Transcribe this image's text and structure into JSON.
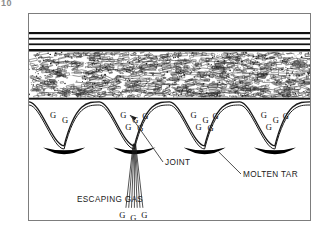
{
  "figure": {
    "number_label": "10"
  },
  "frame": {
    "border_color": "#7d7d7d",
    "background": "#ffffff"
  },
  "colors": {
    "ink": "#111111",
    "line": "#1a1a1a",
    "tar": "#000000",
    "aggregate": "#2b2b2b",
    "leader": "#3a3a3a",
    "frame_border": "#7d7d7d",
    "figure_number": "#8c8c8c"
  },
  "layers": [
    {
      "name": "top-void-space",
      "type": "white-gap",
      "y": 0,
      "height": 18,
      "fill": "#ffffff"
    },
    {
      "name": "membrane-ply-1",
      "type": "solid-line",
      "y": 18,
      "height": 2.4,
      "fill": "#111111"
    },
    {
      "name": "membrane-gap-1",
      "type": "white-gap",
      "y": 20.4,
      "height": 3.4,
      "fill": "#ffffff"
    },
    {
      "name": "membrane-ply-2",
      "type": "solid-line",
      "y": 23.8,
      "height": 2.0,
      "fill": "#111111"
    },
    {
      "name": "membrane-gap-2",
      "type": "white-gap",
      "y": 25.8,
      "height": 3.6,
      "fill": "#ffffff"
    },
    {
      "name": "membrane-ply-3",
      "type": "solid-line",
      "y": 29.4,
      "height": 2.0,
      "fill": "#111111"
    },
    {
      "name": "membrane-gap-3",
      "type": "white-gap",
      "y": 31.4,
      "height": 3.6,
      "fill": "#ffffff"
    },
    {
      "name": "membrane-ply-4",
      "type": "solid-line",
      "y": 35.0,
      "height": 2.6,
      "fill": "#111111"
    },
    {
      "name": "aggregate-fill-layer",
      "type": "texture",
      "y": 37.6,
      "height": 46,
      "fill": "#ffffff"
    },
    {
      "name": "deck-baseline",
      "type": "solid-line",
      "y": 83.6,
      "height": 2.2,
      "fill": "#111111"
    },
    {
      "name": "substrate-blister-zone",
      "type": "arches",
      "y": 85.8,
      "height": 122,
      "fill": "#ffffff"
    }
  ],
  "blisters": {
    "count": 4,
    "description": "Double-stroked arched blisters separated by troughs; molten tar pooled at each trough base",
    "gas_symbol": "G",
    "gas_clusters": [
      {
        "index": 0,
        "letters": [
          "G",
          "G"
        ]
      },
      {
        "index": 1,
        "letters": [
          "G",
          "G",
          "G",
          "G",
          "G"
        ]
      },
      {
        "index": 2,
        "letters": [
          "G",
          "G",
          "G",
          "G",
          "G"
        ]
      },
      {
        "index": 3,
        "letters": [
          "G",
          "G",
          "G",
          "G"
        ]
      }
    ]
  },
  "escaping_gas": {
    "symbols": [
      "G",
      "G",
      "G"
    ],
    "stream_line_count": 7,
    "description": "Thin diverging lines emitted downward from the joint"
  },
  "callouts": [
    {
      "id": "joint",
      "label": "JOINT",
      "leader": "from label up-left to joint gap between blisters"
    },
    {
      "id": "molten-tar",
      "label": "MOLTEN TAR",
      "leader": "from label up-left to black tar pool in trough"
    },
    {
      "id": "escaping-gas",
      "label": "ESCAPING GAS",
      "leader": "none (text sits under the G symbols)"
    }
  ]
}
